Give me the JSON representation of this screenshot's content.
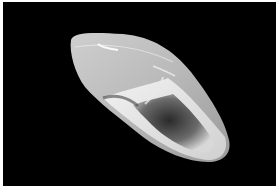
{
  "image": {
    "subject": "snail shell",
    "background_color": "#000000",
    "border_color": "#ffffff",
    "shell_colors": {
      "light": "#e6e6e6",
      "mid": "#b4b4b4",
      "dark": "#3a3a3a"
    }
  }
}
